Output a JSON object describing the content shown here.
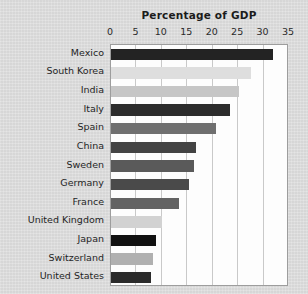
{
  "chart_data": {
    "type": "bar",
    "orientation": "horizontal",
    "title": "Percentage of GDP",
    "xlabel": "",
    "ylabel": "",
    "xlim": [
      0,
      35
    ],
    "ylim": null,
    "grid": true,
    "legend": null,
    "xticks": [
      "0",
      "5",
      "10",
      "15",
      "20",
      "25",
      "30",
      "35"
    ],
    "xtick_values": [
      0,
      5,
      10,
      15,
      20,
      25,
      30,
      35
    ],
    "categories": [
      "Mexico",
      "South Korea",
      "India",
      "Italy",
      "Spain",
      "China",
      "Sweden",
      "Germany",
      "France",
      "United Kingdom",
      "Japan",
      "Switzerland",
      "United States"
    ],
    "values": [
      31.8,
      27.5,
      25.2,
      23.4,
      20.6,
      16.7,
      16.3,
      15.4,
      13.3,
      10.0,
      8.8,
      8.3,
      7.8
    ],
    "bar_colors": [
      "#232323",
      "#dedede",
      "#c6c6c6",
      "#2c2c2c",
      "#6f6f6f",
      "#434343",
      "#5a5a5a",
      "#4a4a4a",
      "#636363",
      "#d2d2d2",
      "#111111",
      "#b0b0b0",
      "#2a2a2a"
    ]
  },
  "figure": {
    "background_color": "#d9d9d9",
    "plot_background_color": "#fdfdfd",
    "axis_border_color": "#9d9d9d",
    "gridline_color": "#c9c9c9"
  }
}
